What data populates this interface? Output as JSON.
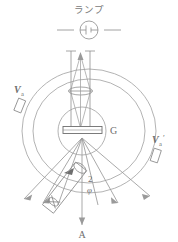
{
  "figure": {
    "title_text": "ランプ",
    "labels": {
      "lamp": "ランプ",
      "grating": "G",
      "vernier_left": "V",
      "vernier_left_sub": "a",
      "vernier_right": "V",
      "vernier_right_sub": "a",
      "vernier_right_prime": "′",
      "angle_num": "2",
      "angle_sym": "φ",
      "telescope_axis": "A"
    },
    "colors": {
      "line": "#8a8a8a",
      "line_dark": "#6e6e6e",
      "ray": "#9a9a9a",
      "text": "#6e6e6e",
      "background": "#ffffff"
    },
    "geometry": {
      "center_x": 89,
      "center_y": 131,
      "outer_circle_rx": 67,
      "outer_circle_ry": 62,
      "inner_circle_rx": 56,
      "inner_circle_ry": 52,
      "table_circle_r": 24
    },
    "components": [
      {
        "name": "lamp-symbol",
        "desc": "circle with battery symbol and leads"
      },
      {
        "name": "collimator-tube",
        "desc": "vertical tube with lens"
      },
      {
        "name": "grating",
        "desc": "horizontal rectangle at center G"
      },
      {
        "name": "telescope-tube",
        "desc": "tilted tube lower-left"
      },
      {
        "name": "divided-circle",
        "desc": "two concentric circles"
      },
      {
        "name": "vernier-a",
        "desc": "small tilted rectangle left"
      },
      {
        "name": "vernier-a-prime",
        "desc": "small tilted rectangle right"
      },
      {
        "name": "diffracted-rays",
        "desc": "fan of arrows from grating"
      }
    ]
  }
}
